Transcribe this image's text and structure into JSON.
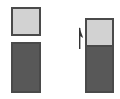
{
  "figure": {
    "title": "",
    "background_color": "#ffffff",
    "width": 120,
    "height": 99
  },
  "palette": {
    "light_block": "#d2d2d2",
    "dark_block": "#585858",
    "outline": "#4a4a4a",
    "arrow": "#333333"
  },
  "left_column": {
    "label": "",
    "light_block": {
      "name": "light-block",
      "label": "",
      "fill": "#d2d2d2",
      "x": 11,
      "y": 7,
      "width": 30,
      "height": 29
    },
    "dark_block": {
      "name": "dark-block",
      "label": "",
      "fill": "#585858",
      "x": 11,
      "y": 42,
      "width": 30,
      "height": 51
    }
  },
  "right_column": {
    "label": "",
    "stack": {
      "name": "stacked-blocks",
      "x": 85,
      "y": 18,
      "width": 29,
      "height": 75,
      "light_segment": {
        "label": "",
        "fill": "#d2d2d2",
        "height": 27
      },
      "dark_segment": {
        "label": "",
        "fill": "#585858",
        "height": 48
      }
    }
  },
  "annotation": {
    "arrow": {
      "name": "up-arrow",
      "direction": "up",
      "label": "",
      "color": "#333333",
      "x": 74,
      "y": 26,
      "width": 12,
      "height": 24
    }
  }
}
